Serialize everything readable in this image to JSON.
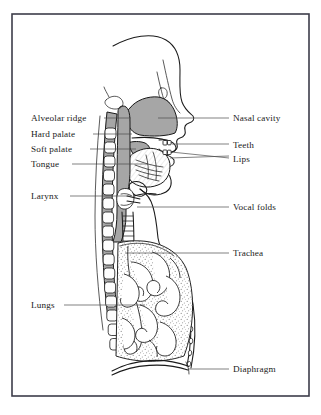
{
  "figure": {
    "caption_partial": "The vocal tract"
  },
  "frame": {
    "border_color": "#3d3d4a",
    "background_color": "#ffffff"
  },
  "colors": {
    "tissue_gray": "#a6a6a6",
    "outline_black": "#1a1a1a",
    "leader_gray": "#4a4a4a",
    "lung_stipple": "#8c8c8c",
    "paper_white": "#ffffff"
  },
  "labels": {
    "left": [
      {
        "id": "alveolar-ridge",
        "text": "Alveolar ridge",
        "text_x": 31,
        "text_y": 121,
        "line_x1": 104,
        "line_y1": 118,
        "line_x2": 131,
        "line_y2": 118
      },
      {
        "id": "hard-palate",
        "text": "Hard palate",
        "text_x": 31,
        "text_y": 137,
        "line_x1": 93,
        "line_y1": 134,
        "line_x2": 132,
        "line_y2": 134
      },
      {
        "id": "soft-palate",
        "text": "Soft palate",
        "text_x": 31,
        "text_y": 152,
        "line_x1": 90,
        "line_y1": 149,
        "line_x2": 136,
        "line_y2": 149
      },
      {
        "id": "tongue",
        "text": "Tongue",
        "text_x": 31,
        "text_y": 167,
        "line_x1": 72,
        "line_y1": 164,
        "line_x2": 148,
        "line_y2": 164
      },
      {
        "id": "larynx",
        "text": "Larynx",
        "text_x": 31,
        "text_y": 199,
        "line_x1": 70,
        "line_y1": 196,
        "line_x2": 131,
        "line_y2": 196
      },
      {
        "id": "lungs",
        "text": "Lungs",
        "text_x": 31,
        "text_y": 308,
        "line_x1": 64,
        "line_y1": 305,
        "line_x2": 145,
        "line_y2": 305
      }
    ],
    "right": [
      {
        "id": "nasal-cavity",
        "text": "Nasal cavity",
        "text_x": 233,
        "text_y": 121,
        "line_x1": 158,
        "line_y1": 118,
        "line_x2": 229,
        "line_y2": 118
      },
      {
        "id": "teeth",
        "text": "Teeth",
        "text_x": 233,
        "text_y": 148,
        "line_x1": 172,
        "line_y1": 144,
        "line_x2": 229,
        "line_y2": 144
      },
      {
        "id": "lips",
        "text": "Lips",
        "text_x": 233,
        "text_y": 162,
        "line_x1": 171,
        "line_y1": 152,
        "line_x2": 229,
        "line_y2": 158
      },
      {
        "id": "vocal-folds",
        "text": "Vocal folds",
        "text_x": 233,
        "text_y": 210,
        "line_x1": 137,
        "line_y1": 207,
        "line_x2": 229,
        "line_y2": 207
      },
      {
        "id": "trachea",
        "text": "Trachea",
        "text_x": 233,
        "text_y": 256,
        "line_x1": 125,
        "line_y1": 253,
        "line_x2": 229,
        "line_y2": 253
      },
      {
        "id": "diaphragm",
        "text": "Diaphragm",
        "text_x": 233,
        "text_y": 372,
        "line_x1": 188,
        "line_y1": 369,
        "line_x2": 229,
        "line_y2": 369
      }
    ]
  }
}
